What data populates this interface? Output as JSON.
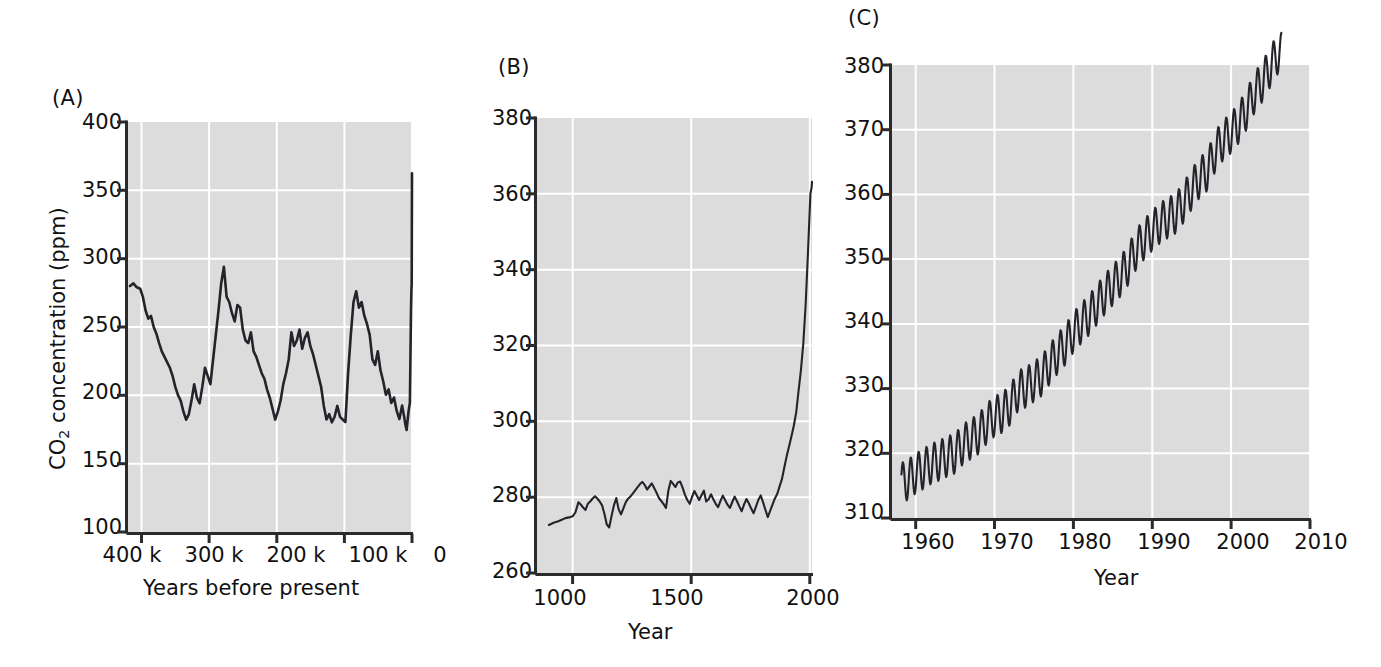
{
  "figure": {
    "background": "#ffffff",
    "plot_background": "#dcdcdc",
    "grid_color": "#ffffff",
    "line_color": "#23242a"
  },
  "panels": {
    "a": {
      "letter": "(A)",
      "ylabel_prefix": "CO",
      "ylabel_sub": "2",
      "ylabel_suffix": " concentration (ppm)",
      "xlabel": "Years before present",
      "yticks": [
        "400",
        "350",
        "300",
        "250",
        "200",
        "150",
        "100"
      ],
      "xticks": [
        "400 k",
        "300 k",
        "200 k",
        "100 k",
        "0"
      ]
    },
    "b": {
      "letter": "(B)",
      "xlabel": "Year",
      "yticks": [
        "380",
        "360",
        "340",
        "320",
        "300",
        "280",
        "260"
      ],
      "xticks": [
        "1000",
        "1500",
        "2000"
      ]
    },
    "c": {
      "letter": "(C)",
      "xlabel": "Year",
      "yticks": [
        "380",
        "370",
        "360",
        "350",
        "340",
        "330",
        "320",
        "310"
      ],
      "xticks": [
        "1960",
        "1970",
        "1980",
        "1990",
        "2000",
        "2010"
      ]
    }
  },
  "chart_data": [
    {
      "type": "line",
      "panel": "A",
      "title": "",
      "xlabel": "Years before present",
      "ylabel": "CO2 concentration (ppm)",
      "xlim": [
        420000,
        0
      ],
      "ylim": [
        100,
        400
      ],
      "x_tick_values": [
        400000,
        300000,
        200000,
        100000,
        0
      ],
      "y_tick_values": [
        400,
        350,
        300,
        250,
        200,
        150,
        100
      ],
      "grid": true,
      "legend": "none",
      "x": [
        417000,
        412000,
        407000,
        402000,
        398000,
        394000,
        390000,
        386000,
        382000,
        378000,
        374000,
        370000,
        366000,
        362000,
        358000,
        354000,
        350000,
        346000,
        342000,
        338000,
        334000,
        330000,
        326000,
        322000,
        318000,
        314000,
        310000,
        306000,
        302000,
        298000,
        294000,
        290000,
        286000,
        282000,
        278000,
        274000,
        270000,
        266000,
        262000,
        258000,
        254000,
        250000,
        246000,
        242000,
        238000,
        234000,
        230000,
        226000,
        222000,
        218000,
        214000,
        210000,
        206000,
        202000,
        198000,
        194000,
        190000,
        186000,
        182000,
        178000,
        174000,
        170000,
        166000,
        162000,
        158000,
        154000,
        150000,
        146000,
        142000,
        138000,
        134000,
        130000,
        126000,
        122000,
        118000,
        114000,
        110000,
        106000,
        102000,
        98000,
        94000,
        90000,
        86000,
        82000,
        78000,
        74000,
        70000,
        66000,
        62000,
        58000,
        54000,
        50000,
        46000,
        42000,
        38000,
        34000,
        30000,
        26000,
        22000,
        18000,
        14000,
        11000,
        9000,
        7000,
        4000,
        2000,
        800,
        300,
        100,
        0
      ],
      "y": [
        280,
        282,
        279,
        278,
        272,
        262,
        256,
        258,
        250,
        245,
        238,
        232,
        228,
        224,
        220,
        214,
        206,
        200,
        196,
        188,
        182,
        186,
        196,
        208,
        198,
        194,
        206,
        220,
        214,
        208,
        226,
        244,
        262,
        282,
        294,
        272,
        268,
        260,
        254,
        266,
        264,
        248,
        240,
        238,
        246,
        232,
        228,
        222,
        216,
        212,
        204,
        198,
        190,
        182,
        188,
        196,
        208,
        216,
        226,
        248,
        240,
        244,
        252,
        238,
        246,
        250,
        240,
        234,
        226,
        218,
        210,
        196,
        186,
        190,
        184,
        188,
        196,
        188,
        186,
        184,
        220,
        248,
        272,
        280,
        268,
        272,
        262,
        256,
        248,
        230,
        226,
        236,
        222,
        214,
        204,
        208,
        198,
        202,
        192,
        186,
        196,
        188,
        182,
        178,
        192,
        198,
        265,
        280,
        285,
        366
      ]
    },
    {
      "type": "line",
      "panel": "B",
      "title": "",
      "xlabel": "Year",
      "ylabel": "CO2 concentration (ppm)",
      "xlim": [
        850,
        2010
      ],
      "ylim": [
        260,
        380
      ],
      "x_tick_values": [
        1000,
        1500,
        2000
      ],
      "y_tick_values": [
        380,
        360,
        340,
        320,
        300,
        280,
        260
      ],
      "grid": true,
      "legend": "none",
      "x": [
        900,
        920,
        940,
        955,
        970,
        985,
        1000,
        1012,
        1025,
        1035,
        1045,
        1055,
        1065,
        1075,
        1085,
        1095,
        1105,
        1115,
        1125,
        1135,
        1145,
        1155,
        1165,
        1175,
        1185,
        1195,
        1205,
        1215,
        1225,
        1235,
        1245,
        1255,
        1265,
        1275,
        1285,
        1295,
        1305,
        1315,
        1325,
        1335,
        1345,
        1355,
        1365,
        1375,
        1385,
        1395,
        1405,
        1415,
        1425,
        1435,
        1445,
        1455,
        1465,
        1475,
        1485,
        1495,
        1505,
        1515,
        1525,
        1535,
        1545,
        1555,
        1565,
        1575,
        1585,
        1595,
        1605,
        1615,
        1625,
        1635,
        1645,
        1655,
        1665,
        1675,
        1685,
        1695,
        1705,
        1715,
        1725,
        1735,
        1745,
        1755,
        1765,
        1775,
        1785,
        1795,
        1805,
        1815,
        1825,
        1835,
        1845,
        1855,
        1865,
        1875,
        1885,
        1895,
        1905,
        1915,
        1925,
        1935,
        1945,
        1955,
        1965,
        1975,
        1985,
        1995,
        2000,
        2002
      ],
      "y": [
        272.2,
        272.8,
        273.2,
        273.6,
        274.0,
        274.2,
        274.5,
        275.5,
        278.2,
        277.6,
        276.8,
        276.2,
        277.8,
        278.4,
        279.2,
        279.8,
        279.2,
        278.4,
        277.4,
        275.2,
        272.4,
        271.6,
        274.6,
        277.4,
        279.2,
        276.4,
        275.0,
        276.6,
        278.2,
        279.0,
        279.6,
        280.2,
        281.0,
        281.8,
        282.6,
        283.2,
        282.4,
        281.2,
        282.0,
        282.8,
        281.6,
        280.4,
        279.0,
        278.2,
        277.4,
        276.4,
        280.6,
        283.2,
        282.4,
        281.6,
        282.8,
        283.0,
        281.4,
        279.6,
        278.2,
        277.2,
        279.0,
        280.6,
        279.4,
        278.2,
        279.4,
        280.6,
        279.6,
        278.4,
        277.6,
        279.6,
        281.0,
        279.8,
        278.6,
        277.6,
        279.2,
        280.6,
        279.4,
        278.0,
        277.2,
        278.8,
        280.2,
        281.0,
        279.6,
        278.4,
        279.8,
        281.2,
        280.0,
        278.6,
        277.4,
        279.0,
        280.8,
        282.2,
        280.4,
        278.2,
        276.6,
        278.4,
        280.4,
        282.0,
        281.0,
        280.0,
        282.6,
        283.0,
        285.2,
        287.4,
        290.2,
        294.0,
        296.6,
        299.2,
        302.0,
        305.4,
        310.0,
        315.6,
        321.0,
        328.0,
        338.0,
        352.0,
        368.0,
        378.0,
        379.5
      ]
    },
    {
      "type": "line",
      "panel": "C",
      "title": "",
      "xlabel": "Year",
      "ylabel": "CO2 concentration (ppm)",
      "xlim": [
        1957,
        2010
      ],
      "ylim": [
        310,
        380
      ],
      "x_tick_values": [
        1960,
        1970,
        1980,
        1990,
        2000,
        2010
      ],
      "y_tick_values": [
        380,
        370,
        360,
        350,
        340,
        330,
        320,
        310
      ],
      "grid": true,
      "legend": "none",
      "description": "Mauna Loa Keeling curve: rising annual-mean CO2 with ~6 ppm seasonal sawtooth oscillation",
      "annual_mean_x": [
        1958,
        1959,
        1960,
        1961,
        1962,
        1963,
        1964,
        1965,
        1966,
        1967,
        1968,
        1969,
        1970,
        1971,
        1972,
        1973,
        1974,
        1975,
        1976,
        1977,
        1978,
        1979,
        1980,
        1981,
        1982,
        1983,
        1984,
        1985,
        1986,
        1987,
        1988,
        1989,
        1990,
        1991,
        1992,
        1993,
        1994,
        1995,
        1996,
        1997,
        1998,
        1999,
        2000,
        2001,
        2002,
        2003,
        2004,
        2005,
        2006
      ],
      "annual_mean_y": [
        315.3,
        315.9,
        316.9,
        317.6,
        318.4,
        318.9,
        319.5,
        320.0,
        321.4,
        322.2,
        323.0,
        324.6,
        325.7,
        326.3,
        327.5,
        329.7,
        330.2,
        331.1,
        332.0,
        333.8,
        335.4,
        336.8,
        338.7,
        340.1,
        341.4,
        343.0,
        344.6,
        346.0,
        347.4,
        349.2,
        351.6,
        353.1,
        354.4,
        355.6,
        356.4,
        357.1,
        358.8,
        360.8,
        362.6,
        363.7,
        366.7,
        368.4,
        369.5,
        371.1,
        373.2,
        375.8,
        377.5,
        379.8,
        381.9
      ],
      "seasonal_amplitude_ppm": 3.1
    }
  ]
}
